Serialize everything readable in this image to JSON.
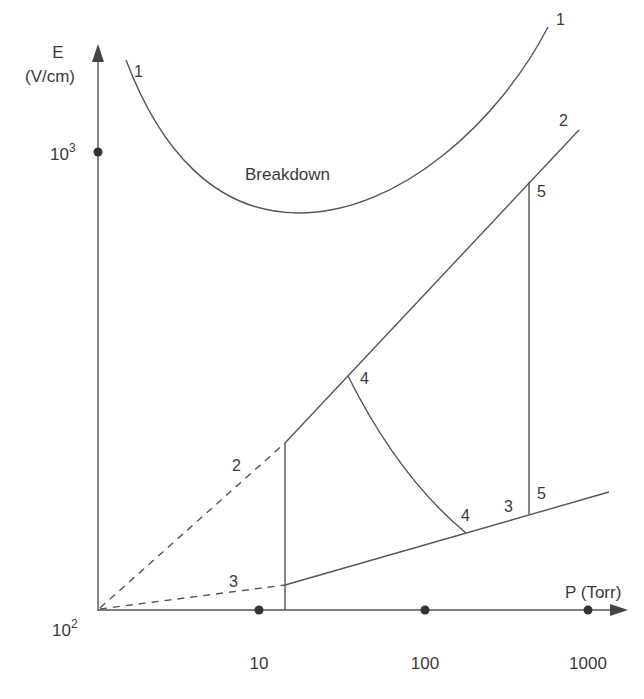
{
  "diagram": {
    "region_label": "Breakdown",
    "y_axis": {
      "label_line1": "E",
      "label_line2": "(V/cm)",
      "ticks": [
        {
          "base": "10",
          "exp": "3"
        },
        {
          "base": "10",
          "exp": "2"
        }
      ]
    },
    "x_axis": {
      "label": "P (Torr)",
      "ticks": [
        "10",
        "100",
        "1000"
      ]
    },
    "curve_labels": {
      "c1_left": "1",
      "c1_right": "1",
      "c2_top": "2",
      "c2_dashed": "2",
      "c3_dashed": "3",
      "c3_right": "3",
      "c4_top": "4",
      "c4_bottom": "4",
      "c5_top": "5",
      "c5_bottom": "5"
    },
    "colors": {
      "line": "#555555",
      "text": "#3a3a3a",
      "background": "#ffffff"
    }
  }
}
